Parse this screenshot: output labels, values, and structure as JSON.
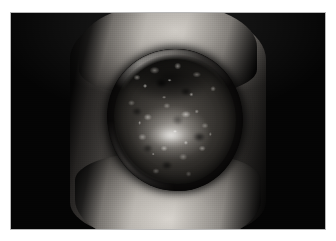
{
  "page": {
    "background_color": "#ffffff",
    "type": "clinical-photograph-figure"
  },
  "figure": {
    "name": "clinical-photograph",
    "modality": "color-photograph-grayscale",
    "frame": {
      "border_color": "#b7b7b7",
      "border_width_px": 1,
      "x": 10,
      "y": 12,
      "width": 316,
      "height": 218
    },
    "background_color": "#040404",
    "caption": "",
    "subject": {
      "anatomy": "lower leg / ankle",
      "lesion": {
        "label": "large round crusted ulcerated plaque",
        "shape": "roughly circular",
        "border": "raised rolled border",
        "surface": "thick adherent crust with granular nodular texture",
        "center": "moist brighter granulation bed",
        "center_x": 164,
        "center_y": 107,
        "width_px": 136,
        "height_px": 142
      },
      "lighting": "frontal flash, dark background, bright highlight on skin above and below lesion",
      "skin_tone_range": [
        "#2e2c2a",
        "#d2cec8"
      ]
    },
    "colors": {
      "photo_black": "#040404",
      "lesion_dark": "#171614",
      "lesion_mid": "#403d39",
      "lesion_light": "#ecece6",
      "skin_highlight": "#dad6d0",
      "skin_shadow": "#232120",
      "frame_border": "#b7b7b7"
    }
  }
}
